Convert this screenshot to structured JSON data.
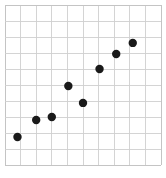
{
  "figure": {
    "width": 166,
    "height": 178,
    "background_color": "#ffffff",
    "grid_color": "#cfcfcf",
    "border_color": "#c4c4c4",
    "point_color": "#1a1a1a",
    "point_radius_px": 4.2
  },
  "chart_data": {
    "type": "scatter",
    "title": "",
    "subtitle": "",
    "xlabel": "",
    "ylabel": "",
    "xlim": [
      0,
      10
    ],
    "ylim": [
      0,
      10
    ],
    "grid": true,
    "grid_major_step_x": 1,
    "grid_major_step_y": 1,
    "xticks": [
      0,
      1,
      2,
      3,
      4,
      5,
      6,
      7,
      8,
      9,
      10
    ],
    "yticks": [
      0,
      1,
      2,
      3,
      4,
      5,
      6,
      7,
      8,
      9,
      10
    ],
    "xticklabels": [],
    "yticklabels": [],
    "legend": [],
    "legend_position": "none",
    "annotations": [],
    "series": [
      {
        "name": "points",
        "marker": "circle",
        "color": "#1a1a1a",
        "x": [
          0.8,
          2.0,
          3.0,
          4.06,
          5.0,
          6.06,
          7.13,
          8.19
        ],
        "y": [
          1.75,
          2.81,
          3.0,
          4.94,
          3.88,
          6.0,
          6.94,
          7.63
        ],
        "points": [
          {
            "x": 0.8,
            "y": 1.75
          },
          {
            "x": 2.0,
            "y": 2.81
          },
          {
            "x": 3.0,
            "y": 3.0
          },
          {
            "x": 4.06,
            "y": 4.94
          },
          {
            "x": 5.0,
            "y": 3.88
          },
          {
            "x": 6.06,
            "y": 6.0
          },
          {
            "x": 7.13,
            "y": 6.94
          },
          {
            "x": 8.19,
            "y": 7.63
          }
        ]
      }
    ]
  }
}
